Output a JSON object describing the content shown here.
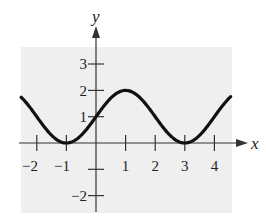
{
  "chart_data": {
    "type": "line",
    "title": "",
    "xlabel": "x",
    "ylabel": "y",
    "xlim": [
      -2.55,
      4.6
    ],
    "ylim": [
      -2.5,
      3.6
    ],
    "grid": false,
    "background": "#efefef",
    "line_color": "#111111",
    "x_ticks": [
      -2,
      -1,
      1,
      2,
      3,
      4
    ],
    "x_tick_labels": [
      "−2",
      "−1",
      "1",
      "2",
      "3",
      "4"
    ],
    "y_ticks": [
      -2,
      -1,
      1,
      2,
      3
    ],
    "y_tick_labels": [
      "−2",
      "",
      "1",
      "2",
      "3"
    ],
    "series": [
      {
        "name": "curve",
        "description": "periodic curve y = 1 + sin(pi x / 2), max 2 at x=1, min 0 at x=-1 and x=3, passes through (0,1)",
        "x": [
          -2.5,
          -2,
          -1.5,
          -1,
          -0.5,
          0,
          0.5,
          1,
          1.5,
          2,
          2.5,
          3,
          3.5,
          4,
          4.5
        ],
        "values": [
          1.71,
          1,
          0.29,
          0,
          0.29,
          1,
          1.71,
          2,
          1.71,
          1,
          0.29,
          0,
          0.29,
          1,
          1.71
        ]
      }
    ]
  }
}
